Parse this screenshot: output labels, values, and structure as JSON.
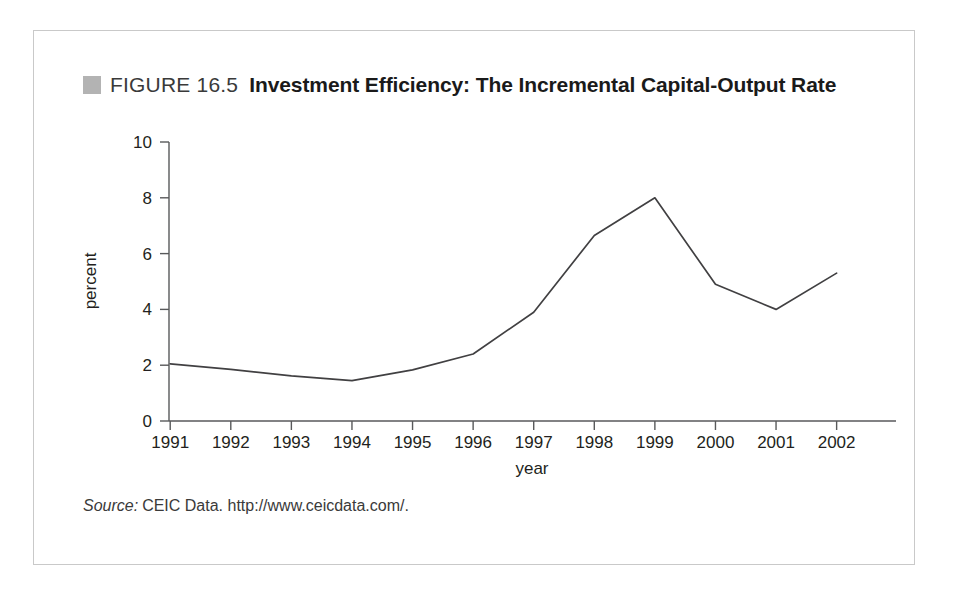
{
  "figure": {
    "marker_icon": "gray-square-icon",
    "label": "FIGURE 16.5",
    "title": "Investment Efficiency: The Incremental Capital-Output Rate",
    "source_word": "Source:",
    "source_text": "CEIC Data. http://www.ceicdata.com/."
  },
  "colors": {
    "marker": "#b3b3b3",
    "line": "#414042",
    "axis": "#58595b",
    "border": "#c9c9c9",
    "text": "#231f20",
    "background": "#ffffff"
  },
  "chart_data": {
    "type": "line",
    "title": "Investment Efficiency: The Incremental Capital-Output Rate",
    "xlabel": "year",
    "ylabel": "percent",
    "categories": [
      "1991",
      "1992",
      "1993",
      "1994",
      "1995",
      "1996",
      "1997",
      "1998",
      "1999",
      "2000",
      "2001",
      "2002"
    ],
    "x": [
      1991,
      1992,
      1993,
      1994,
      1995,
      1996,
      1997,
      1998,
      1999,
      2000,
      2001,
      2002
    ],
    "values": [
      2.05,
      1.85,
      1.62,
      1.45,
      1.83,
      2.4,
      3.9,
      6.65,
      8.0,
      4.9,
      4.0,
      5.3
    ],
    "series": [
      {
        "name": "Incremental capital-output rate",
        "values": [
          2.05,
          1.85,
          1.62,
          1.45,
          1.83,
          2.4,
          3.9,
          6.65,
          8.0,
          4.9,
          4.0,
          5.3
        ]
      }
    ],
    "ylim": [
      0,
      10
    ],
    "yticks": [
      0,
      2,
      4,
      6,
      8,
      10
    ],
    "ytick_labels": [
      "0",
      "2",
      "4",
      "6",
      "8",
      "10"
    ],
    "xtick_labels": [
      "1991",
      "1992",
      "1993",
      "1994",
      "1995",
      "1996",
      "1997",
      "1998",
      "1999",
      "2000",
      "2001",
      "2002"
    ],
    "grid": false,
    "legend": false
  }
}
